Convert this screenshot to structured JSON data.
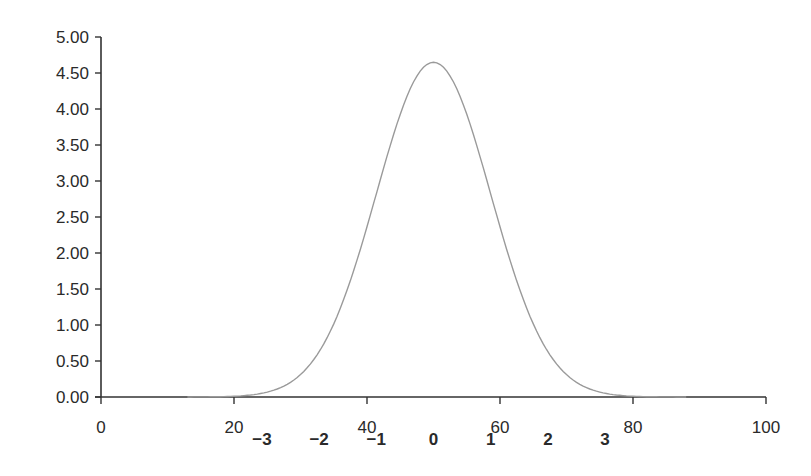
{
  "chart_data": {
    "type": "line",
    "title": "",
    "xlabel": "",
    "ylabel": "",
    "xlim": [
      0,
      100
    ],
    "ylim": [
      0,
      5
    ],
    "grid": false,
    "legend": null,
    "x_ticks": [
      "0",
      "20",
      "40",
      "60",
      "80",
      "100"
    ],
    "y_ticks": [
      "0.00",
      "0.50",
      "1.00",
      "1.50",
      "2.00",
      "2.50",
      "3.00",
      "3.50",
      "4.00",
      "4.50",
      "5.00"
    ],
    "secondary_x_labels": {
      "description": "Standard deviation (z-score) markers beneath the x axis",
      "labels": [
        "−3",
        "−2",
        "−1",
        "0",
        "1",
        "2",
        "3"
      ],
      "positions": [
        24.2,
        32.8,
        41.4,
        50,
        58.6,
        67.2,
        75.8
      ]
    },
    "series": [
      {
        "name": "Normal distribution (mean 50, SD ≈ 8.6)",
        "color": "#9a9a9a",
        "x": [
          13,
          16,
          20,
          24,
          27,
          30,
          33,
          36,
          39,
          42,
          45,
          48,
          50,
          52,
          55,
          58,
          61,
          64,
          67,
          70,
          73,
          76,
          80,
          84,
          88
        ],
        "y": [
          0.07,
          0.14,
          0.32,
          0.61,
          0.91,
          1.35,
          1.84,
          2.48,
          3.08,
          3.74,
          4.23,
          4.58,
          4.65,
          4.58,
          4.23,
          3.74,
          3.08,
          2.48,
          1.84,
          1.35,
          0.91,
          0.61,
          0.32,
          0.14,
          0.07
        ]
      }
    ],
    "mean": 50,
    "sd": 8.6,
    "peak": 4.65
  }
}
